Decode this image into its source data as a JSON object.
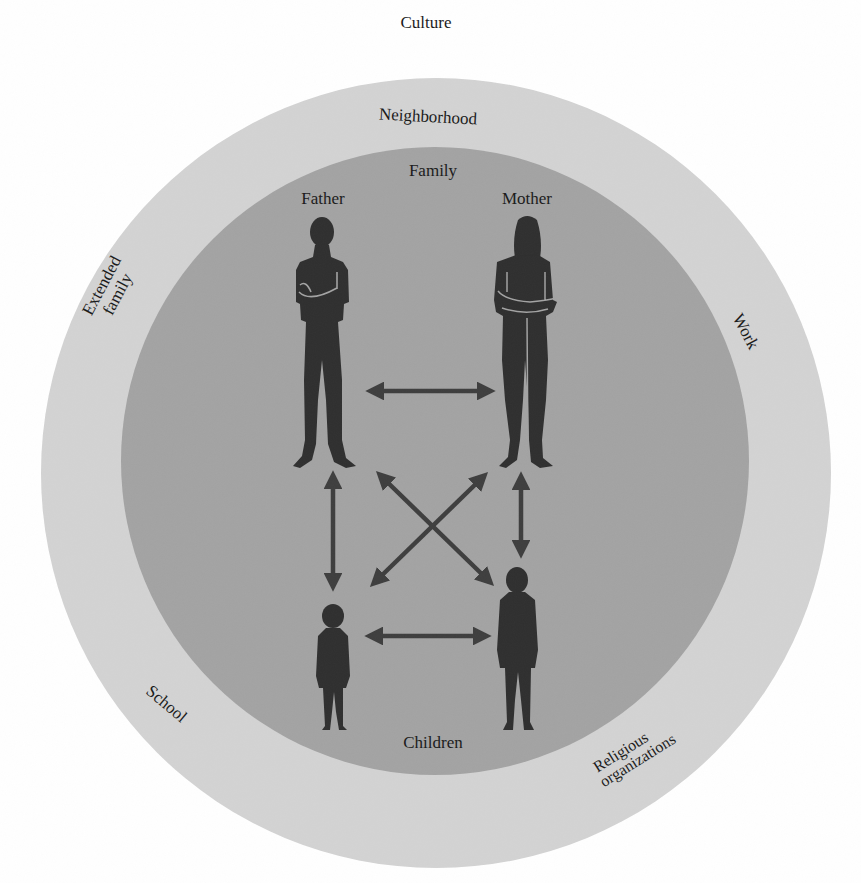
{
  "diagram": {
    "type": "ecological-systems-diagram",
    "outer_label_top": "Culture",
    "rings": {
      "outer": {
        "name": "community-ring",
        "color": "#d3d3d3",
        "labels": {
          "neighborhood": "Neighborhood",
          "extended_family_line1": "Extended",
          "extended_family_line2": "family",
          "work": "Work",
          "school": "School",
          "religious_line1": "Religious",
          "religious_line2": "organizations"
        }
      },
      "inner": {
        "name": "family-circle",
        "color": "#a3a3a3",
        "label_top": "Family",
        "label_bottom": "Children"
      }
    },
    "members": {
      "father": "Father",
      "mother": "Mother"
    },
    "figure_color": "#2f2f2f",
    "arrow_color": "#3e3e3e",
    "relationships": [
      {
        "from": "Father",
        "to": "Mother"
      },
      {
        "from": "Father",
        "to": "Younger child"
      },
      {
        "from": "Father",
        "to": "Older child"
      },
      {
        "from": "Mother",
        "to": "Younger child"
      },
      {
        "from": "Mother",
        "to": "Older child"
      },
      {
        "from": "Younger child",
        "to": "Older child"
      }
    ]
  }
}
